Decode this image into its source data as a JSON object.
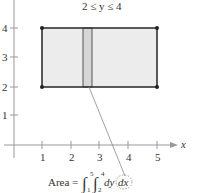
{
  "diagram": {
    "title_constraint": "2 ≤ y ≤ 4",
    "x_axis_label": "x",
    "x_ticks": [
      "1",
      "2",
      "3",
      "4",
      "5"
    ],
    "y_ticks": [
      "1",
      "2",
      "3",
      "4",
      "5"
    ],
    "region": {
      "x_min": 1,
      "x_max": 5,
      "y_min": 2,
      "y_max": 4
    },
    "strip_label": "vertical representative rectangle",
    "formula": {
      "prefix": "Area = ",
      "outer_lower": "1",
      "outer_upper": "5",
      "inner_lower": "2",
      "inner_upper": "4",
      "inner_diff": "dy",
      "outer_diff": "dx"
    },
    "colors": {
      "region_fill": "#ececec",
      "strip_fill": "#d4d4d4",
      "stroke": "#333333",
      "axis": "#888888"
    }
  }
}
